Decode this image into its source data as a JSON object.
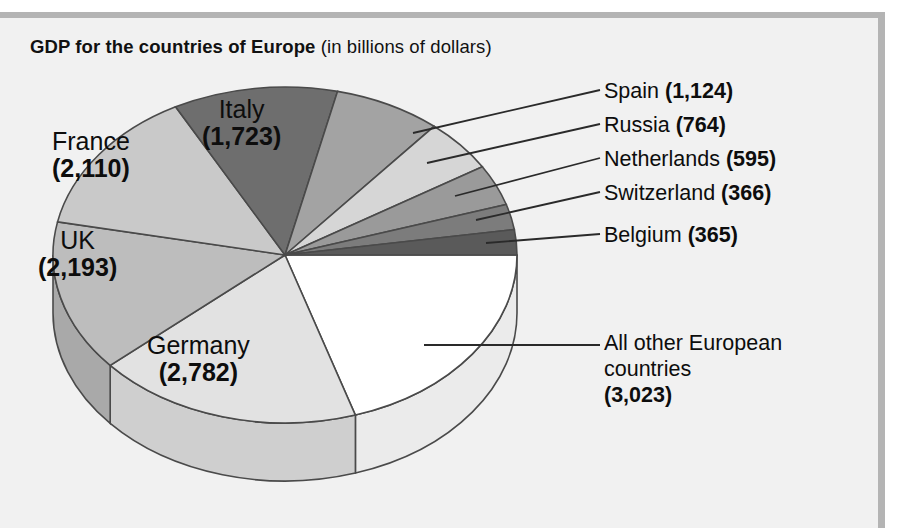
{
  "title": {
    "bold_part": "GDP for the countries of Europe",
    "light_part": " (in billions of dollars)"
  },
  "chart_data": {
    "type": "pie",
    "title": "GDP for the countries of Europe (in billions of dollars)",
    "units": "billions of dollars",
    "total": 15045,
    "legend_position": "callouts",
    "three_d": true,
    "categories": [
      "Germany",
      "UK",
      "France",
      "Italy",
      "Spain",
      "Russia",
      "Netherlands",
      "Switzerland",
      "Belgium",
      "All other European countries"
    ],
    "values": [
      2782,
      2193,
      2110,
      1723,
      1124,
      764,
      595,
      366,
      365,
      3023
    ],
    "slices": [
      {
        "name": "Germany",
        "value": 2782,
        "label": "Germany",
        "value_text": "(2,782)",
        "color": "#e2e2e2",
        "side_color": "#cfcfcf",
        "label_style": "inside",
        "percent": 18.5
      },
      {
        "name": "UK",
        "value": 2193,
        "label": "UK",
        "value_text": "(2,193)",
        "color": "#bdbdbd",
        "side_color": "#a9a9a9",
        "label_style": "inside",
        "percent": 14.6
      },
      {
        "name": "France",
        "value": 2110,
        "label": "France",
        "value_text": "(2,110)",
        "color": "#c9c9c9",
        "side_color": "#b5b5b5",
        "label_style": "inside",
        "percent": 14.0
      },
      {
        "name": "Italy",
        "value": 1723,
        "label": "Italy",
        "value_text": "(1,723)",
        "color": "#6e6e6e",
        "side_color": "#5c5c5c",
        "label_style": "inside",
        "percent": 11.5
      },
      {
        "name": "Spain",
        "value": 1124,
        "label": "Spain",
        "value_text": "(1,124)",
        "color": "#a3a3a3",
        "side_color": "#909090",
        "label_style": "callout",
        "percent": 7.5
      },
      {
        "name": "Russia",
        "value": 764,
        "label": "Russia",
        "value_text": "(764)",
        "color": "#d6d6d6",
        "side_color": "#c2c2c2",
        "label_style": "callout",
        "percent": 5.1
      },
      {
        "name": "Netherlands",
        "value": 595,
        "label": "Netherlands",
        "value_text": "(595)",
        "color": "#9a9a9a",
        "side_color": "#878787",
        "label_style": "callout",
        "percent": 4.0
      },
      {
        "name": "Switzerland",
        "value": 366,
        "label": "Switzerland",
        "value_text": "(366)",
        "color": "#7c7c7c",
        "side_color": "#6a6a6a",
        "label_style": "callout",
        "percent": 2.4
      },
      {
        "name": "Belgium",
        "value": 365,
        "label": "Belgium",
        "value_text": "(365)",
        "color": "#5a5a5a",
        "side_color": "#4a4a4a",
        "label_style": "callout",
        "percent": 2.4
      },
      {
        "name": "All other European countries",
        "value": 3023,
        "label": "All other European countries",
        "value_text": "(3,023)",
        "color": "#ffffff",
        "side_color": "#ebebeb",
        "label_style": "callout",
        "percent": 20.1
      }
    ]
  },
  "pie_labels": {
    "italy": {
      "name": "Italy",
      "value": "(1,723)"
    },
    "france": {
      "name": "France",
      "value": "(2,110)"
    },
    "uk": {
      "name": "UK",
      "value": "(2,193)"
    },
    "germany": {
      "name": "Germany",
      "value": "(2,782)"
    }
  },
  "callouts": {
    "spain": {
      "name": "Spain ",
      "value": "(1,124)"
    },
    "russia": {
      "name": "Russia ",
      "value": "(764)"
    },
    "netherlands": {
      "name": "Netherlands ",
      "value": "(595)"
    },
    "switzerland": {
      "name": "Switzerland ",
      "value": "(366)"
    },
    "belgium": {
      "name": "Belgium ",
      "value": "(365)"
    },
    "other": {
      "line1": "All other European",
      "line2": "countries",
      "value": "(3,023)"
    }
  },
  "colors": {
    "background": "#f1f1f1",
    "frame": "#b4b4b4",
    "stroke": "#4a4a4a",
    "text": "#0d0d0d"
  }
}
